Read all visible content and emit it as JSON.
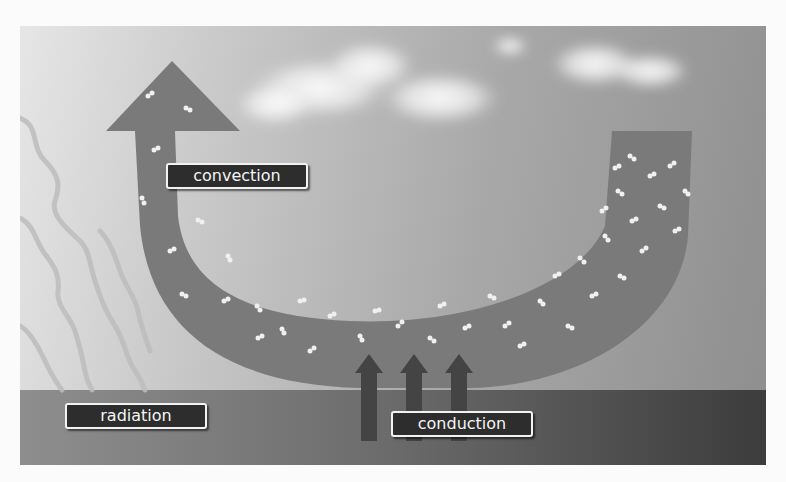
{
  "diagram": {
    "labels": {
      "convection": "convection",
      "radiation": "radiation",
      "conduction": "conduction"
    },
    "elements": {
      "convection_arrow": "U-shaped arrow filled with air molecules rising from ground to sky",
      "radiation_waves": "wavy lines descending from upper left to ground",
      "conduction_arrows": 3,
      "clouds": 2
    },
    "colors": {
      "label_bg": "#2d2d2d",
      "label_text": "#f4f4f4",
      "arrow_fill": "#7a7a7a",
      "ground_dark": "#3c3c3c",
      "sky_light": "#e6e6e6"
    }
  }
}
